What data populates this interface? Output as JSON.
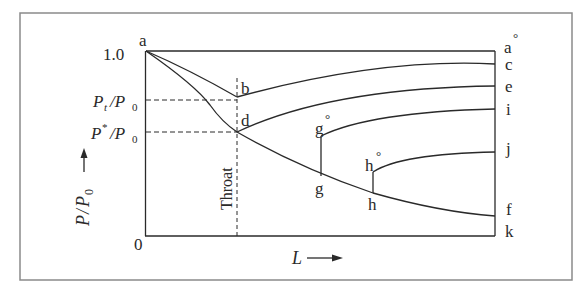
{
  "diagram": {
    "y_axis": {
      "label_P": "P",
      "label_slash": "/",
      "label_P0": "P",
      "label_P0_sub": "0",
      "tick_top": "1.0",
      "tick_bottom": "0",
      "tick_pt_P": "P",
      "tick_pt_sub": "t",
      "tick_pt_den": "/P",
      "tick_pt_den_sub": "0",
      "tick_pstar_P": "P",
      "tick_pstar_sup": "*",
      "tick_pstar_den": "/P",
      "tick_pstar_den_sub": "0"
    },
    "x_axis": {
      "label": "L"
    },
    "throat_label": "Throat",
    "points": {
      "a": "a",
      "b": "b",
      "d": "d",
      "g0": "g",
      "g": "g",
      "h0": "h",
      "h": "h",
      "a0": "a",
      "c": "c",
      "e": "e",
      "i": "i",
      "j": "j",
      "f": "f",
      "k": "k"
    },
    "degree_mark": "°",
    "colors": {
      "line": "#2a2a2a",
      "frame": "#8a8a8a"
    }
  }
}
